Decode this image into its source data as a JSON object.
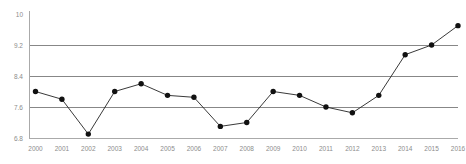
{
  "chart_data": {
    "type": "line",
    "title": "",
    "subtitle": "",
    "xlabel": "",
    "ylabel": "",
    "categories": [
      "2000",
      "2001",
      "2002",
      "2003",
      "2004",
      "2005",
      "2006",
      "2007",
      "2008",
      "2009",
      "2010",
      "2011",
      "2012",
      "2013",
      "2014",
      "2015",
      "2016"
    ],
    "values": [
      8.0,
      7.8,
      6.9,
      8.0,
      8.2,
      7.9,
      7.85,
      7.1,
      7.2,
      8.0,
      7.9,
      7.6,
      7.45,
      7.9,
      8.95,
      9.2,
      9.7
    ],
    "series": [
      {
        "name": "series-1",
        "values": [
          8.0,
          7.8,
          6.9,
          8.0,
          8.2,
          7.9,
          7.85,
          7.1,
          7.2,
          8.0,
          7.9,
          7.6,
          7.45,
          7.9,
          8.95,
          9.2,
          9.7
        ]
      }
    ],
    "x_tick_labels": [
      "2000",
      "2001",
      "2002",
      "2003",
      "2004",
      "2005",
      "2006",
      "2007",
      "2008",
      "2009",
      "2010",
      "2011",
      "2012",
      "2013",
      "2014",
      "2015",
      "2016"
    ],
    "y_tick_labels": [
      "10",
      "9.2",
      "8.4",
      "7.6",
      "6.8"
    ],
    "y_tick_values": [
      10,
      9.2,
      8.4,
      7.6,
      6.8
    ],
    "ylim": [
      6.8,
      10
    ],
    "xlim": [
      "2000",
      "2016"
    ],
    "grid": "horizontal",
    "gridlines_at": [
      9.2,
      8.4,
      7.6
    ],
    "legend": "none",
    "legend_position": "none",
    "annotations": [],
    "colors": {
      "line": "#222222",
      "marker": "#111111",
      "gridline": "#7a7a7a",
      "axis": "#aaaaaa",
      "tick_text": "#8c8c8c",
      "background": "#ffffff"
    }
  }
}
